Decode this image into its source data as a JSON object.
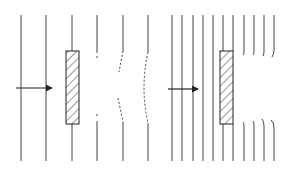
{
  "figure": {
    "background": "#ffffff",
    "stroke": "#333333",
    "panels": [
      {
        "name": "long-wavelength",
        "wavefront_x": [
          21,
          46,
          72,
          97,
          123,
          148
        ],
        "obstacle": {
          "x": 66,
          "y": 51,
          "w": 13,
          "h": 73
        },
        "arrow": {
          "x1": 16,
          "x2": 52,
          "y": 88
        }
      },
      {
        "name": "short-wavelength",
        "wavefront_x": [
          172,
          182,
          193,
          203,
          213,
          223,
          233,
          244,
          254,
          264,
          274
        ],
        "obstacle": {
          "x": 220,
          "y": 51,
          "w": 13,
          "h": 73
        },
        "arrow": {
          "x1": 168,
          "x2": 198,
          "y": 89
        }
      }
    ]
  }
}
